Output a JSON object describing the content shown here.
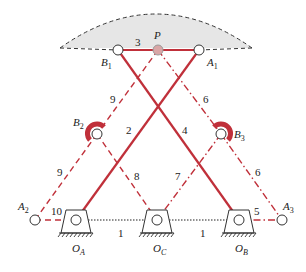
{
  "diagram": {
    "type": "linkage-mechanism",
    "colors": {
      "link": "#c0303a",
      "region_fill": "#e6e6e6",
      "region_stroke": "#333333",
      "pin_fill": "#ffffff",
      "P_fill": "#d9a6a6",
      "ground": "#333333",
      "text": "#222222"
    },
    "joints": {
      "B1": "B",
      "B1_sub": "1",
      "A1": "A",
      "A1_sub": "1",
      "P": "P",
      "B2": "B",
      "B2_sub": "2",
      "B3": "B",
      "B3_sub": "3",
      "A2": "A",
      "A2_sub": "2",
      "A3": "A",
      "A3_sub": "3",
      "OA": "O",
      "OA_sub": "A",
      "OC": "O",
      "OC_sub": "C",
      "OB": "O",
      "OB_sub": "B"
    },
    "link_labels": {
      "l1a": "1",
      "l1b": "1",
      "l2": "2",
      "l3": "3",
      "l4": "4",
      "l5": "5",
      "l6a": "6",
      "l6b": "6",
      "l7": "7",
      "l8": "8",
      "l9a": "9",
      "l9b": "9",
      "l10": "10"
    }
  }
}
